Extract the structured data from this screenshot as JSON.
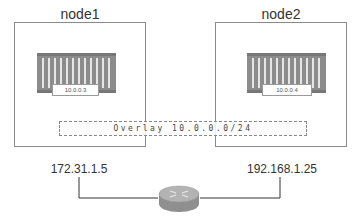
{
  "nodes": [
    {
      "title": "node1",
      "container_ip": "10.0.0.3",
      "host_ip": "172.31.1.5"
    },
    {
      "title": "node2",
      "container_ip": "10.0.0.4",
      "host_ip": "192.168.1.25"
    }
  ],
  "overlay": {
    "label": "Overlay 10.0.0.0/24"
  },
  "icons": {
    "container": "shipping-container-icon",
    "router": "router-icon"
  },
  "colors": {
    "border": "#8a8a8a",
    "container": "#8c8c8c",
    "router": "#9a9a9a",
    "line": "#333333"
  }
}
